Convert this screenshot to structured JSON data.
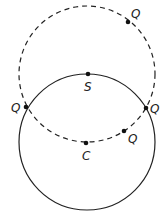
{
  "diagram": {
    "circles": [
      {
        "name": "solid-circle",
        "cx": 87,
        "cy": 142,
        "r": 68,
        "style": "solid",
        "center_label": "C"
      },
      {
        "name": "dashed-circle",
        "cx": 87,
        "cy": 74,
        "r": 68,
        "style": "dashed",
        "center_label": "S"
      }
    ],
    "points": [
      {
        "id": "S",
        "label": "S",
        "x": 88,
        "y": 74,
        "lx": 84,
        "ly": 91
      },
      {
        "id": "C",
        "label": "C",
        "x": 86,
        "y": 143,
        "lx": 82,
        "ly": 160
      },
      {
        "id": "Q1",
        "label": "Q",
        "x": 128,
        "y": 22,
        "lx": 131,
        "ly": 18
      },
      {
        "id": "Q2",
        "label": "Q",
        "x": 26,
        "y": 107,
        "lx": 13,
        "ly": 112
      },
      {
        "id": "Q3",
        "label": "Q",
        "x": 146,
        "y": 108,
        "lx": 150,
        "ly": 113
      },
      {
        "id": "Q4",
        "label": "Q",
        "x": 124,
        "y": 131,
        "lx": 128,
        "ly": 142
      }
    ],
    "colors": {
      "stroke": "#222222",
      "background": "#ffffff"
    }
  }
}
